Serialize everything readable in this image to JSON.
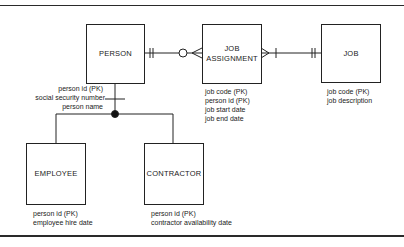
{
  "diagram": {
    "type": "entity-relationship",
    "entities": [
      {
        "id": "person",
        "name": "PERSON",
        "attributes": [
          "person id (PK)",
          "social security number",
          "person name"
        ]
      },
      {
        "id": "job_assignment",
        "name_line1": "JOB",
        "name_line2": "ASSIGNMENT",
        "attributes": [
          "job code (PK)",
          "person id (PK)",
          "job start date",
          "job end date"
        ]
      },
      {
        "id": "job",
        "name": "JOB",
        "attributes": [
          "job code (PK)",
          "job description"
        ]
      },
      {
        "id": "employee",
        "name": "EMPLOYEE",
        "attributes": [
          "person id (PK)",
          "employee hire date"
        ]
      },
      {
        "id": "contractor",
        "name": "CONTRACTOR",
        "attributes": [
          "person id (PK)",
          "contractor availability date"
        ]
      }
    ],
    "relationships": [
      {
        "from": "PERSON",
        "to": "JOB ASSIGNMENT",
        "from_cardinality": "one and only one",
        "to_cardinality": "zero or many"
      },
      {
        "from": "JOB ASSIGNMENT",
        "to": "JOB",
        "from_cardinality": "one or many",
        "to_cardinality": "one and only one"
      },
      {
        "supertype": "PERSON",
        "subtypes": [
          "EMPLOYEE",
          "CONTRACTOR"
        ],
        "notation": "subtype discriminator (filled dot)"
      }
    ]
  }
}
